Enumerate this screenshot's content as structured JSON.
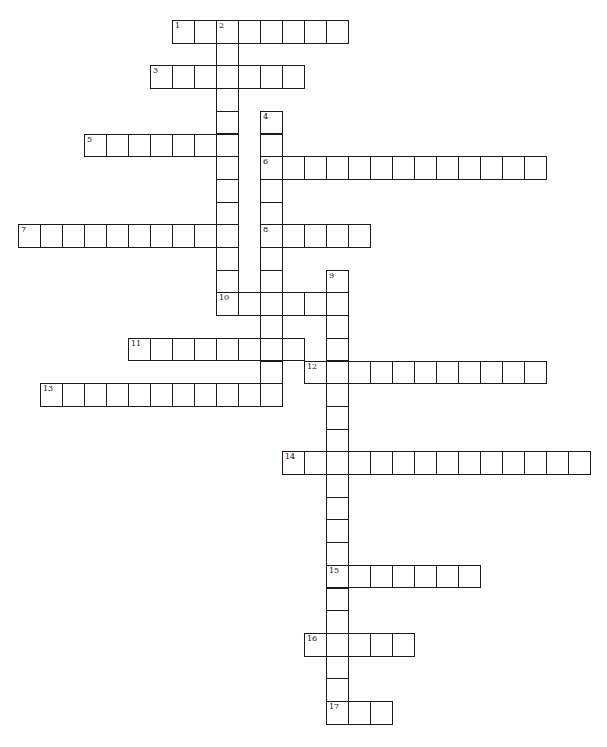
{
  "puzzle": {
    "type": "crossword",
    "layout": {
      "x0": 18,
      "y0": 20,
      "col_pitch": 22,
      "row_pitch": 22.7
    },
    "colors": {
      "border": "#1a1a1a",
      "cell_bg": "#ffffff",
      "page_bg": "#ffffff"
    },
    "across": [
      {
        "number": "1",
        "row": 0,
        "col": 7,
        "length": 8
      },
      {
        "number": "3",
        "row": 2,
        "col": 6,
        "length": 7
      },
      {
        "number": "5",
        "row": 5,
        "col": 3,
        "length": 7
      },
      {
        "number": "6",
        "row": 6,
        "col": 11,
        "length": 13
      },
      {
        "number": "7",
        "row": 9,
        "col": 0,
        "length": 10
      },
      {
        "number": "8",
        "row": 9,
        "col": 11,
        "length": 5
      },
      {
        "number": "10",
        "row": 12,
        "col": 9,
        "length": 6
      },
      {
        "number": "11",
        "row": 14,
        "col": 5,
        "length": 8
      },
      {
        "number": "12",
        "row": 15,
        "col": 13,
        "length": 11
      },
      {
        "number": "13",
        "row": 16,
        "col": 1,
        "length": 11
      },
      {
        "number": "14",
        "row": 19,
        "col": 12,
        "length": 14
      },
      {
        "number": "15",
        "row": 24,
        "col": 14,
        "length": 7
      },
      {
        "number": "16",
        "row": 27,
        "col": 13,
        "length": 5
      },
      {
        "number": "17",
        "row": 30,
        "col": 14,
        "length": 3
      }
    ],
    "down": [
      {
        "number": "2",
        "row": 0,
        "col": 9,
        "length": 13
      },
      {
        "number": "4",
        "row": 4,
        "col": 11,
        "length": 13
      },
      {
        "number": "9",
        "row": 11,
        "col": 14,
        "length": 20
      }
    ]
  }
}
